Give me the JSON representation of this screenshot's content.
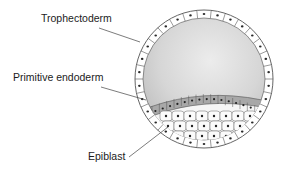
{
  "diagram": {
    "labels": [
      {
        "id": "trophectoderm",
        "text": "Trophectoderm",
        "x": 41,
        "y": 14
      },
      {
        "id": "primitive-endoderm",
        "text": "Primitive endoderm",
        "x": 13,
        "y": 73
      },
      {
        "id": "epiblast",
        "text": "Epiblast",
        "x": 88,
        "y": 152
      }
    ],
    "colors": {
      "cell_outline": "#555555",
      "nucleus": "#2a2a2a",
      "cavity_shade": "#d4d4d4",
      "endoderm_fill": "#a9a9a9",
      "epiblast_fill": "#f4f4f4",
      "leader_line": "#444444"
    }
  }
}
